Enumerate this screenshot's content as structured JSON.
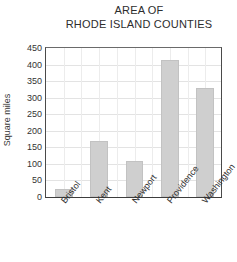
{
  "chart_data": {
    "type": "bar",
    "title": "AREA OF RHODE ISLAND COUNTIES",
    "title_lines": [
      "AREA OF",
      "RHODE ISLAND COUNTIES"
    ],
    "xlabel": "",
    "ylabel": "Square miles",
    "categories": [
      "Bristol",
      "Kent",
      "Newport",
      "Providence",
      "Washington"
    ],
    "values": [
      25,
      170,
      110,
      415,
      330
    ],
    "ylim": [
      0,
      450
    ],
    "ytick_values": [
      450,
      400,
      350,
      300,
      250,
      200,
      150,
      100,
      50,
      0
    ],
    "ytick_labels": [
      "450",
      "400",
      "350",
      "300",
      "250",
      "200",
      "150",
      "100",
      "50",
      "0"
    ],
    "grid": true,
    "grid_vertical_count": 10,
    "legend": null,
    "bar_color": "#cfcfcf",
    "axis_color": "#3d3d3d",
    "grid_color": "#e3e3e3"
  }
}
